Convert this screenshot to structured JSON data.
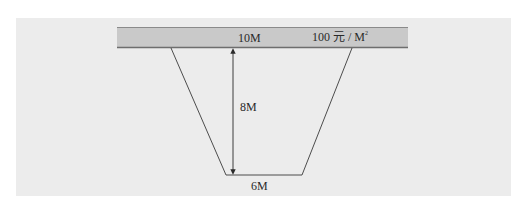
{
  "diagram": {
    "ground_surface": {
      "label": "ground-surface-band",
      "fill_color": "#c9c9c9",
      "edge_color": "#6e6e6e"
    },
    "labels": {
      "top_width": "10M",
      "price_prefix": "100 元 / M",
      "price_superscript": "2",
      "depth": "8M",
      "bottom_width": "6M"
    },
    "dimensions": {
      "top_width_m": 10,
      "bottom_width_m": 6,
      "depth_m": 8,
      "unit_price_yuan_per_m2": 100
    },
    "colors": {
      "panel_background": "#ececec",
      "line": "#3a3a3a",
      "text": "#2a2a2a"
    }
  }
}
